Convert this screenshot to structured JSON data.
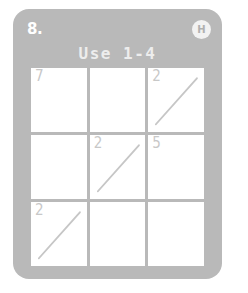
{
  "card": {
    "puzzle_number": "8.",
    "difficulty_badge": "H",
    "title": "Use 1-4",
    "card_color": "#b9b9b9",
    "cell_color": "#ffffff",
    "clue_color": "#c8c8c8",
    "title_color": "#ededed"
  },
  "grid": {
    "rows": 3,
    "columns": 3,
    "cells": [
      {
        "position": "top-left",
        "clue": "7",
        "diagonal": false
      },
      {
        "position": "top-center",
        "clue": "",
        "diagonal": false
      },
      {
        "position": "top-right",
        "clue": "2",
        "diagonal": true
      },
      {
        "position": "middle-left",
        "clue": "",
        "diagonal": false
      },
      {
        "position": "middle-center",
        "clue": "2",
        "diagonal": true
      },
      {
        "position": "middle-right",
        "clue": "5",
        "diagonal": false
      },
      {
        "position": "bottom-left",
        "clue": "2",
        "diagonal": true
      },
      {
        "position": "bottom-center",
        "clue": "",
        "diagonal": false
      },
      {
        "position": "bottom-right",
        "clue": "",
        "diagonal": false
      }
    ]
  }
}
